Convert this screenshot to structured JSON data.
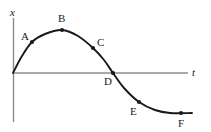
{
  "chart_data": {
    "type": "line",
    "title": "",
    "xlabel": "t",
    "ylabel": "x",
    "grid": false,
    "legend": null,
    "axes": {
      "vertical_axis_label": "x",
      "horizontal_axis_label": "t",
      "origin": [
        13,
        73
      ],
      "vertical_axis_top": 18,
      "vertical_axis_bottom": 122,
      "horizontal_axis_right": 188,
      "axis_color": "#8c8c8c"
    },
    "curve": {
      "color": "#1a1a1a",
      "description": "Smooth sinusoid-like displacement curve rising from origin to a maximum, falling through the time axis, reaching a minimum and flattening out",
      "points": [
        {
          "t": 13,
          "x": 73
        },
        {
          "t": 22,
          "x": 56
        },
        {
          "t": 32,
          "x": 42
        },
        {
          "t": 45,
          "x": 34
        },
        {
          "t": 62,
          "x": 30
        },
        {
          "t": 78,
          "x": 36
        },
        {
          "t": 93,
          "x": 48
        },
        {
          "t": 104,
          "x": 60
        },
        {
          "t": 113,
          "x": 73
        },
        {
          "t": 124,
          "x": 88
        },
        {
          "t": 139,
          "x": 102
        },
        {
          "t": 155,
          "x": 110
        },
        {
          "t": 170,
          "x": 113
        },
        {
          "t": 192,
          "x": 113
        }
      ]
    },
    "markers": [
      {
        "label": "A",
        "t": 32,
        "x": 42,
        "label_pos": "upper-left"
      },
      {
        "label": "B",
        "t": 62,
        "x": 30,
        "label_pos": "above"
      },
      {
        "label": "C",
        "t": 93,
        "x": 48,
        "label_pos": "upper-right"
      },
      {
        "label": "D",
        "t": 113,
        "x": 73,
        "label_pos": "below-left"
      },
      {
        "label": "E",
        "t": 139,
        "x": 102,
        "label_pos": "below-left"
      },
      {
        "label": "F",
        "t": 181,
        "x": 113,
        "label_pos": "below"
      }
    ],
    "marker_color": "#1a1a1a"
  },
  "labels": {
    "y_axis": "x",
    "x_axis": "t",
    "a": "A",
    "b": "B",
    "c": "C",
    "d": "D",
    "e": "E",
    "f": "F"
  }
}
